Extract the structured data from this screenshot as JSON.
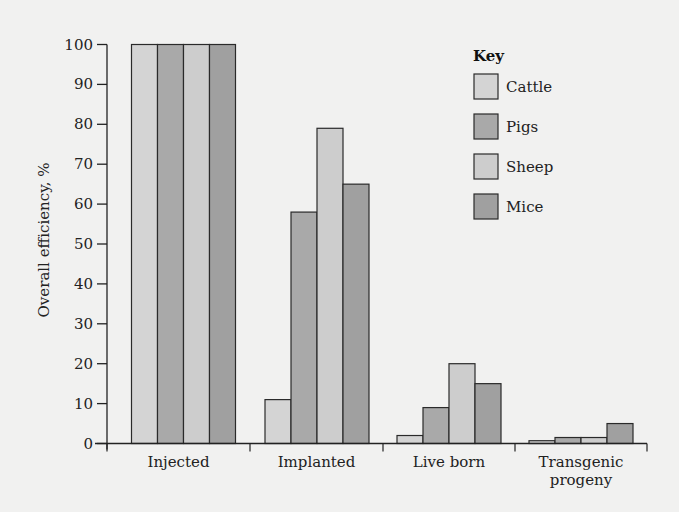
{
  "chart_data": {
    "type": "bar",
    "title": "",
    "xlabel": "",
    "ylabel": "Overall efficiency, %",
    "ylim": [
      0,
      100
    ],
    "yticks": [
      0,
      10,
      20,
      30,
      40,
      50,
      60,
      70,
      80,
      90,
      100
    ],
    "grid": false,
    "legend_position": "top-right",
    "legend_title": "Key",
    "categories": [
      "Injected",
      "Implanted",
      "Live born",
      "Transgenic progeny"
    ],
    "category_label_lines": [
      [
        "Injected"
      ],
      [
        "Implanted"
      ],
      [
        "Live born"
      ],
      [
        "Transgenic",
        "progeny"
      ]
    ],
    "series": [
      {
        "name": "Cattle",
        "color": "#d4d4d4",
        "values": [
          100,
          11,
          2,
          0.7
        ]
      },
      {
        "name": "Pigs",
        "color": "#a9a9a9",
        "values": [
          100,
          58,
          9,
          1.5
        ]
      },
      {
        "name": "Sheep",
        "color": "#cdcdcd",
        "values": [
          100,
          79,
          20,
          1.5
        ]
      },
      {
        "name": "Mice",
        "color": "#a0a0a0",
        "values": [
          100,
          65,
          15,
          5
        ]
      }
    ]
  }
}
